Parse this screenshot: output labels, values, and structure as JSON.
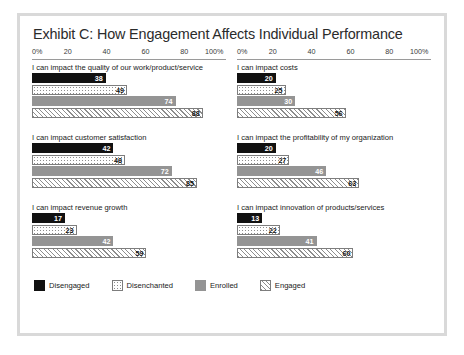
{
  "chart_data": {
    "type": "bar",
    "title": "Exhibit C: How Engagement Affects Individual Performance",
    "xlabel": "",
    "ylabel": "",
    "xlim": [
      0,
      100
    ],
    "grid": false,
    "legend_position": "bottom-left",
    "axis": {
      "ticks": [
        "0%",
        "20",
        "40",
        "60",
        "80",
        "100%"
      ],
      "tick_values": [
        0,
        20,
        40,
        60,
        80,
        100
      ]
    },
    "series_names": [
      "Disengaged",
      "Disenchanted",
      "Enrolled",
      "Engaged"
    ],
    "panels": [
      {
        "label": "I can impact the quality of our work/product/service",
        "values": [
          38,
          49,
          74,
          88
        ]
      },
      {
        "label": "I can impact costs",
        "values": [
          20,
          25,
          30,
          56
        ]
      },
      {
        "label": "I can impact customer satisfaction",
        "values": [
          42,
          48,
          72,
          85
        ]
      },
      {
        "label": "I can impact the profitability of my organization",
        "values": [
          20,
          27,
          46,
          63
        ]
      },
      {
        "label": "I can impact revenue growth",
        "values": [
          17,
          23,
          42,
          59
        ]
      },
      {
        "label": "I can impact innovation of products/services",
        "values": [
          13,
          22,
          41,
          60
        ]
      }
    ],
    "legend": [
      {
        "name": "Disengaged",
        "pattern": "solid-black",
        "color": "#111111"
      },
      {
        "name": "Disenchanted",
        "pattern": "dotted",
        "color": "#ffffff"
      },
      {
        "name": "Enrolled",
        "pattern": "solid-gray",
        "color": "#949494"
      },
      {
        "name": "Engaged",
        "pattern": "diagonal-hatch",
        "color": "#ffffff"
      }
    ]
  }
}
